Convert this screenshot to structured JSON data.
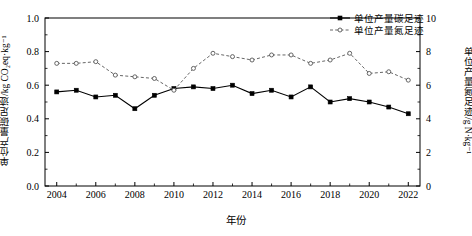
{
  "chart_data": {
    "type": "line",
    "title": "",
    "xlabel": "年份",
    "ylabel": "单位产量碳足迹/kg CO₂eq·kg⁻¹",
    "ylabel_right": "单位产量氮足迹/g N·kg⁻¹",
    "x": [
      2004,
      2005,
      2006,
      2007,
      2008,
      2009,
      2010,
      2011,
      2012,
      2013,
      2014,
      2015,
      2016,
      2017,
      2018,
      2019,
      2020,
      2021,
      2022
    ],
    "xlim": [
      2003.4,
      2022.6
    ],
    "xticks": [
      2004,
      2006,
      2008,
      2010,
      2012,
      2014,
      2016,
      2018,
      2020,
      2022
    ],
    "xticklabels": [
      "2004",
      "2006",
      "2008",
      "2010",
      "2012",
      "2014",
      "2016",
      "2018",
      "2020",
      "2022"
    ],
    "ylim": [
      0.0,
      1.0
    ],
    "yticks": [
      0.0,
      0.2,
      0.4,
      0.6,
      0.8,
      1.0
    ],
    "yticklabels": [
      "0.0",
      "0.2",
      "0.4",
      "0.6",
      "0.8",
      "1.0"
    ],
    "ylim_right": [
      0,
      10
    ],
    "yticks_right": [
      0,
      2,
      4,
      6,
      8,
      10
    ],
    "yticklabels_right": [
      "0",
      "2",
      "4",
      "6",
      "8",
      "10"
    ],
    "grid": false,
    "legend_position": "top-right",
    "series": [
      {
        "name": "单位产量碳足迹",
        "axis": "left",
        "units": "kg CO₂eq·kg⁻¹",
        "linestyle": "solid",
        "marker": "filled-square",
        "color": "#000000",
        "values": [
          0.56,
          0.57,
          0.53,
          0.54,
          0.46,
          0.54,
          0.58,
          0.59,
          0.58,
          0.6,
          0.55,
          0.57,
          0.53,
          0.59,
          0.5,
          0.52,
          0.5,
          0.47,
          0.43
        ]
      },
      {
        "name": "单位产量氮足迹",
        "axis": "right",
        "units": "g N·kg⁻¹",
        "linestyle": "dashed",
        "marker": "open-circle",
        "color": "#555555",
        "values": [
          7.3,
          7.3,
          7.4,
          6.6,
          6.5,
          6.4,
          5.7,
          7.0,
          7.9,
          7.7,
          7.5,
          7.8,
          7.8,
          7.3,
          7.5,
          7.9,
          6.7,
          6.8,
          6.3
        ]
      }
    ]
  }
}
